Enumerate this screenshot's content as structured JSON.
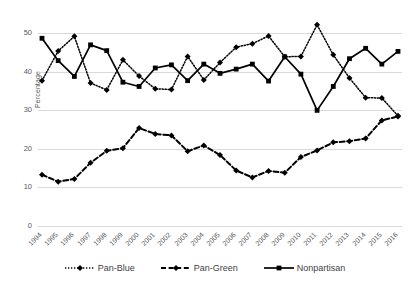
{
  "chart_data": {
    "type": "line",
    "title": "",
    "xlabel": "",
    "ylabel": "Percentage",
    "ylim": [
      0,
      55
    ],
    "yticks": [
      0,
      10,
      20,
      30,
      40,
      50
    ],
    "grid": true,
    "legend_position": "bottom",
    "categories": [
      "1994",
      "1995",
      "1996",
      "1997",
      "1998",
      "1999",
      "2000",
      "2001",
      "2002",
      "2003",
      "2004",
      "2005",
      "2006",
      "2007",
      "2008",
      "2009",
      "2010",
      "2011",
      "2012",
      "2013",
      "2014",
      "2015",
      "2016"
    ],
    "series": [
      {
        "name": "Pan-Blue",
        "color": "#000000",
        "line_style": "dotted",
        "marker": "diamond",
        "values": [
          37.7,
          45.4,
          49.2,
          37.1,
          35.3,
          43.1,
          38.9,
          35.6,
          35.4,
          44.0,
          37.9,
          42.4,
          46.4,
          47.3,
          49.3,
          43.9,
          44.0,
          52.2,
          44.4,
          38.4,
          33.3,
          33.2,
          28.6
        ]
      },
      {
        "name": "Pan-Green",
        "color": "#000000",
        "line_style": "dashed",
        "marker": "diamond",
        "values": [
          13.3,
          11.5,
          12.2,
          16.4,
          19.5,
          20.2,
          25.4,
          23.9,
          23.5,
          19.4,
          20.9,
          18.4,
          14.4,
          12.6,
          14.3,
          13.8,
          17.9,
          19.6,
          21.7,
          22.0,
          22.7,
          27.4,
          28.4
        ]
      },
      {
        "name": "Nonpartisan",
        "color": "#000000",
        "line_style": "solid",
        "marker": "square",
        "values": [
          48.7,
          42.9,
          38.8,
          47.0,
          45.5,
          37.3,
          36.2,
          41.0,
          41.8,
          37.7,
          42.0,
          39.6,
          40.7,
          42.0,
          37.6,
          43.9,
          39.4,
          30.0,
          36.2,
          43.4,
          46.1,
          42.0,
          45.3
        ]
      }
    ]
  }
}
